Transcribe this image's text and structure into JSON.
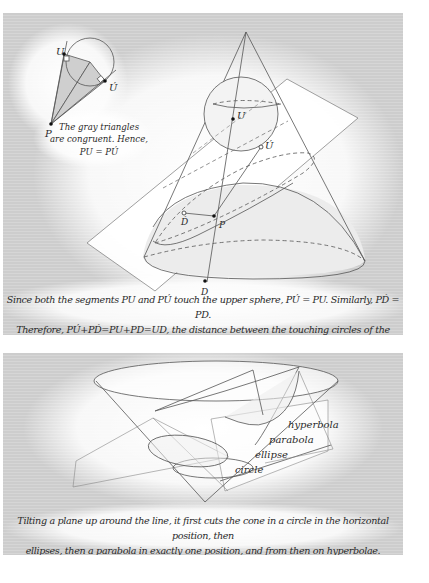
{
  "figure_top": {
    "inset": {
      "labels": {
        "u": "U",
        "u_prime": "Ú",
        "p": "P"
      },
      "note_lines": [
        "The gray triangles",
        "are congruent. Hence,",
        "PU = PÚ"
      ]
    },
    "main_labels": {
      "u": "U",
      "u_prime": "Ú",
      "p": "P",
      "d": "D",
      "d_prime": "D́"
    },
    "caption_lines": [
      "Since both the segments PU and PÚ touch the upper sphere, PÚ = PU. Similarly, PD́ = PD.",
      "Therefore, PÚ+PD́=PU+PD=UD, the distance between the touching circles of the spheres."
    ]
  },
  "figure_bottom": {
    "conic_labels": {
      "hyperbola": "hyperbola",
      "parabola": "parabola",
      "ellipse": "ellipse",
      "circle": "circle"
    },
    "caption_lines": [
      "Tilting a plane up around the line, it first cuts the cone in a circle in the horizontal position, then",
      "ellipses, then a parabola in exactly one position, and from then on hyperbolae."
    ]
  },
  "colors": {
    "background": "#d4d4d4",
    "glow": "#ffffff",
    "line": "#555555",
    "shade": "#c8c8c8",
    "text": "#2a2a2a"
  }
}
